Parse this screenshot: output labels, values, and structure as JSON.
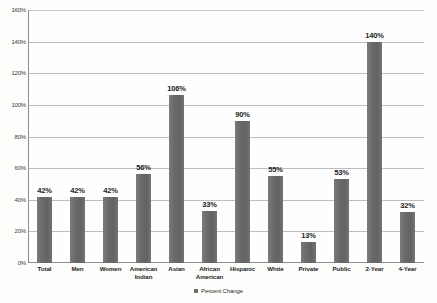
{
  "chart_data": {
    "type": "bar",
    "title": "",
    "subtitle": "",
    "xlabel": "",
    "ylabel": "",
    "ylim": [
      0,
      160
    ],
    "ytick_labels": [
      "0%",
      "20%",
      "40%",
      "60%",
      "80%",
      "100%",
      "120%",
      "140%",
      "160%"
    ],
    "ytick_values": [
      0,
      20,
      40,
      60,
      80,
      100,
      120,
      140,
      160
    ],
    "grid": true,
    "legend_position": "bottom",
    "series": [
      {
        "name": "Percent Change",
        "color": "#6e6e6e",
        "values": [
          42,
          42,
          42,
          56,
          106,
          33,
          90,
          55,
          13,
          53,
          140,
          32
        ]
      }
    ],
    "categories": [
      "Total",
      "Men",
      "Women",
      "American Indian",
      "Asian",
      "African American",
      "Hispanic",
      "White",
      "Private",
      "Public",
      "2-Year",
      "4-Year"
    ],
    "data_labels": [
      "42%",
      "42%",
      "42%",
      "56%",
      "106%",
      "33%",
      "90%",
      "55%",
      "13%",
      "53%",
      "140%",
      "32%"
    ]
  },
  "legend": {
    "swatch_name": "percent-change-swatch",
    "label": "Percent Change"
  },
  "colors": {
    "bar": "#6e6e6e",
    "gridline": "#bdbdbd",
    "axis": "#8c8c8c",
    "text": "#1c1c1c",
    "background": "#fdfdfc"
  }
}
